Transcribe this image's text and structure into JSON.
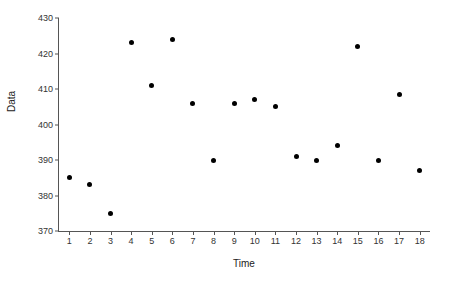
{
  "chart_data": {
    "type": "scatter",
    "title": "",
    "xlabel": "Time",
    "ylabel": "Data",
    "xlim": [
      0.5,
      18.5
    ],
    "ylim": [
      370,
      430
    ],
    "x_ticks": [
      1,
      2,
      3,
      4,
      5,
      6,
      7,
      8,
      9,
      10,
      11,
      12,
      13,
      14,
      15,
      16,
      17,
      18
    ],
    "y_ticks": [
      370,
      380,
      390,
      400,
      410,
      420,
      430
    ],
    "grid": false,
    "legend": "none",
    "marker_color": "#000000",
    "axis_color": "#555555",
    "x": [
      1,
      2,
      3,
      4,
      5,
      6,
      7,
      8,
      9,
      10,
      11,
      12,
      13,
      14,
      15,
      16,
      17,
      18
    ],
    "values": [
      385,
      383,
      375,
      423,
      411,
      424,
      406,
      390,
      406,
      407,
      405,
      391,
      390,
      394,
      422,
      390,
      408.5,
      387
    ],
    "series": [
      {
        "name": "Data",
        "points": [
          {
            "x": 1,
            "y": 385
          },
          {
            "x": 2,
            "y": 383
          },
          {
            "x": 3,
            "y": 375
          },
          {
            "x": 4,
            "y": 423
          },
          {
            "x": 5,
            "y": 411
          },
          {
            "x": 6,
            "y": 424
          },
          {
            "x": 7,
            "y": 406
          },
          {
            "x": 8,
            "y": 390
          },
          {
            "x": 9,
            "y": 406
          },
          {
            "x": 10,
            "y": 407
          },
          {
            "x": 11,
            "y": 405
          },
          {
            "x": 12,
            "y": 391
          },
          {
            "x": 13,
            "y": 390
          },
          {
            "x": 14,
            "y": 394
          },
          {
            "x": 15,
            "y": 422
          },
          {
            "x": 16,
            "y": 390
          },
          {
            "x": 17,
            "y": 408.5
          },
          {
            "x": 18,
            "y": 387
          }
        ]
      }
    ]
  }
}
